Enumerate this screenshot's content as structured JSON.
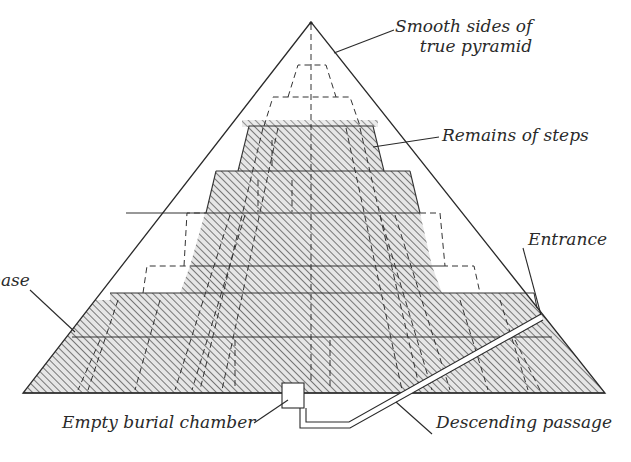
{
  "diagram": {
    "title": "",
    "colors": {
      "ink": "#2a2a2a",
      "hatch": "#555555",
      "fill_bg": "#e2e2e2",
      "background": "#ffffff"
    },
    "labels": {
      "smooth_sides_line1": "Smooth sides of",
      "smooth_sides_line2": "true pyramid",
      "remains_of_steps": "Remains of steps",
      "entrance": "Entrance",
      "base": "base",
      "empty_burial_chamber": "Empty burial chamber",
      "descending_passage": "Descending passage"
    },
    "geometry": {
      "apex": [
        311,
        22
      ],
      "base_left": [
        23,
        393
      ],
      "base_right": [
        605,
        393
      ],
      "burial_chamber": {
        "x": 282,
        "y": 383,
        "w": 22,
        "h": 25
      },
      "entrance_point": [
        541,
        318
      ]
    }
  }
}
